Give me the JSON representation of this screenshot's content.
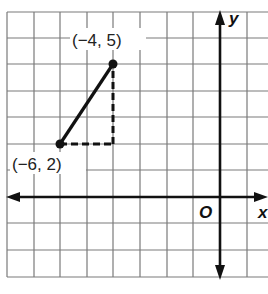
{
  "diagram": {
    "type": "coordinate-grid",
    "axes": {
      "x_label": "x",
      "y_label": "y",
      "origin_label": "O"
    },
    "grid": {
      "x_min": -8,
      "x_max": 1,
      "y_min": -3,
      "y_max": 7,
      "unit_px": 26.7
    },
    "points": [
      {
        "x": -4,
        "y": 5,
        "label": "(−4, 5)"
      },
      {
        "x": -6,
        "y": 2,
        "label": "(−6, 2)"
      }
    ],
    "segment": {
      "from": [
        -6,
        2
      ],
      "to": [
        -4,
        5
      ],
      "style": "solid"
    },
    "dashed_legs": [
      {
        "from": [
          -6,
          2
        ],
        "to": [
          -4,
          2
        ]
      },
      {
        "from": [
          -4,
          2
        ],
        "to": [
          -4,
          5
        ]
      }
    ],
    "colors": {
      "grid": "#777777",
      "ink": "#111111",
      "background": "#ffffff"
    }
  }
}
